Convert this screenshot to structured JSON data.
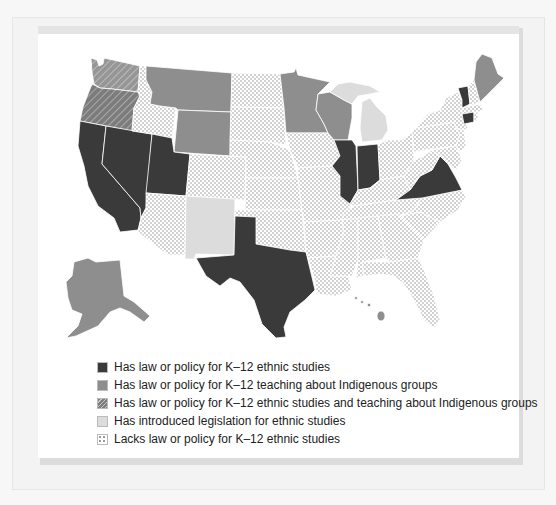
{
  "colors": {
    "ethnic_studies": "#3a3a3a",
    "indigenous": "#8e8e8e",
    "both": "#8e8e8e",
    "introduced": "#dcdcdc",
    "lacks": "#ffffff",
    "dot": "#9a9a9a",
    "border": "#ffffff"
  },
  "legend": {
    "items": [
      {
        "key": "ethnic_studies",
        "label": "Has law or policy for K–12 ethnic studies"
      },
      {
        "key": "indigenous",
        "label": "Has law or policy for K–12 teaching about Indigenous groups"
      },
      {
        "key": "both",
        "label": "Has law or policy for K–12 ethnic studies and teaching about Indigenous groups"
      },
      {
        "key": "introduced",
        "label": "Has introduced legislation for ethnic studies"
      },
      {
        "key": "lacks",
        "label": "Lacks law or policy for K–12 ethnic studies"
      }
    ]
  },
  "states": {
    "ethnic_studies": [
      "California",
      "Nevada",
      "Utah",
      "Texas",
      "Illinois",
      "Indiana",
      "Virginia",
      "Vermont",
      "Connecticut"
    ],
    "indigenous": [
      "Montana",
      "Wyoming",
      "Minnesota",
      "Wisconsin",
      "Maine",
      "Alaska",
      "Hawaii"
    ],
    "both": [
      "Washington",
      "Oregon"
    ],
    "introduced": [
      "New Mexico",
      "Michigan"
    ],
    "lacks": [
      "Idaho",
      "Arizona",
      "Colorado",
      "North Dakota",
      "South Dakota",
      "Nebraska",
      "Kansas",
      "Oklahoma",
      "Iowa",
      "Missouri",
      "Arkansas",
      "Louisiana",
      "Mississippi",
      "Alabama",
      "Georgia",
      "Florida",
      "South Carolina",
      "North Carolina",
      "Tennessee",
      "Kentucky",
      "Ohio",
      "West Virginia",
      "Pennsylvania",
      "New York",
      "New Jersey",
      "Delaware",
      "Maryland",
      "Massachusetts",
      "New Hampshire",
      "Rhode Island"
    ]
  }
}
